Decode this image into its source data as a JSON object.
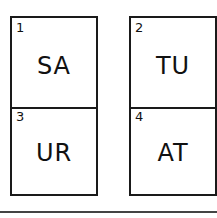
{
  "cards": [
    {
      "number": "1",
      "letters": "SA"
    },
    {
      "number": "2",
      "letters": "TU"
    },
    {
      "number": "3",
      "letters": "UR"
    },
    {
      "number": "4",
      "letters": "AT"
    }
  ]
}
